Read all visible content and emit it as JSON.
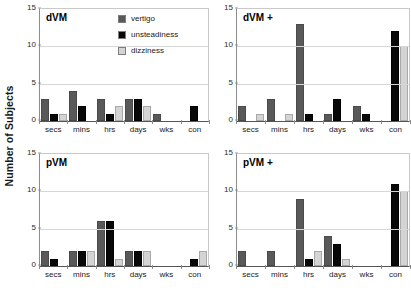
{
  "chart_data": {
    "type": "bar",
    "title": "",
    "xlabel": "",
    "ylabel": "Number of Subjects",
    "ylim": [
      0,
      15
    ],
    "yticks": [
      0,
      5,
      10,
      15
    ],
    "grid": true,
    "legend_position": "top-center-of-first-panel",
    "categories": [
      "secs",
      "mins",
      "hrs",
      "days",
      "wks",
      "con"
    ],
    "legend": [
      {
        "name": "vertigo",
        "color": "#595959"
      },
      {
        "name": "unsteadiness",
        "color": "#080808"
      },
      {
        "name": "dizziness",
        "color": "#d4d4d4"
      }
    ],
    "panels": [
      {
        "id": "dVM",
        "title": "dVM",
        "series": [
          {
            "name": "vertigo",
            "values": [
              3,
              4,
              3,
              3,
              1,
              0
            ]
          },
          {
            "name": "unsteadiness",
            "values": [
              1,
              2,
              1,
              3,
              0,
              2
            ]
          },
          {
            "name": "dizziness",
            "values": [
              1,
              0,
              2,
              2,
              0,
              0
            ]
          }
        ]
      },
      {
        "id": "dVM-plus",
        "title": "dVM +",
        "series": [
          {
            "name": "vertigo",
            "values": [
              2,
              3,
              13,
              1,
              2,
              0
            ]
          },
          {
            "name": "unsteadiness",
            "values": [
              0,
              0,
              1,
              3,
              1,
              12
            ]
          },
          {
            "name": "dizziness",
            "values": [
              1,
              1,
              0,
              0,
              0,
              10
            ]
          }
        ]
      },
      {
        "id": "pVM",
        "title": "pVM",
        "series": [
          {
            "name": "vertigo",
            "values": [
              2,
              2,
              6,
              2,
              0,
              0
            ]
          },
          {
            "name": "unsteadiness",
            "values": [
              1,
              2,
              6,
              2,
              0,
              1
            ]
          },
          {
            "name": "dizziness",
            "values": [
              0,
              2,
              1,
              2,
              0,
              2
            ]
          }
        ]
      },
      {
        "id": "pVM-plus",
        "title": "pVM +",
        "series": [
          {
            "name": "vertigo",
            "values": [
              2,
              2,
              9,
              4,
              0,
              0
            ]
          },
          {
            "name": "unsteadiness",
            "values": [
              0,
              0,
              1,
              3,
              0,
              11
            ]
          },
          {
            "name": "dizziness",
            "values": [
              0,
              0,
              2,
              1,
              0,
              10
            ]
          }
        ]
      }
    ]
  }
}
